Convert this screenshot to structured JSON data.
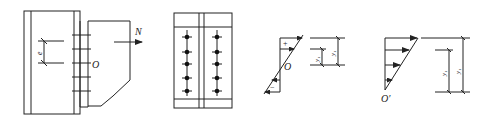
{
  "diagram": {
    "type": "structural-bolt-connection",
    "panels": [
      {
        "id": "connection-elevation",
        "labels": {
          "force": "N",
          "center": "O",
          "eccentricity": "e"
        },
        "bolt_rows": 5
      },
      {
        "id": "bolt-layout-plan",
        "bolt_columns": 2,
        "bolt_rows": 5
      },
      {
        "id": "stress-distribution-about-O",
        "labels": {
          "center": "O",
          "tension_sign": "+",
          "compression_sign": "−",
          "dim_inner": "y₁",
          "dim_outer": "y₁"
        }
      },
      {
        "id": "stress-distribution-about-O-prime",
        "labels": {
          "center": "O′",
          "dim_inner": "y₁",
          "dim_outer": "y₁"
        }
      }
    ]
  }
}
